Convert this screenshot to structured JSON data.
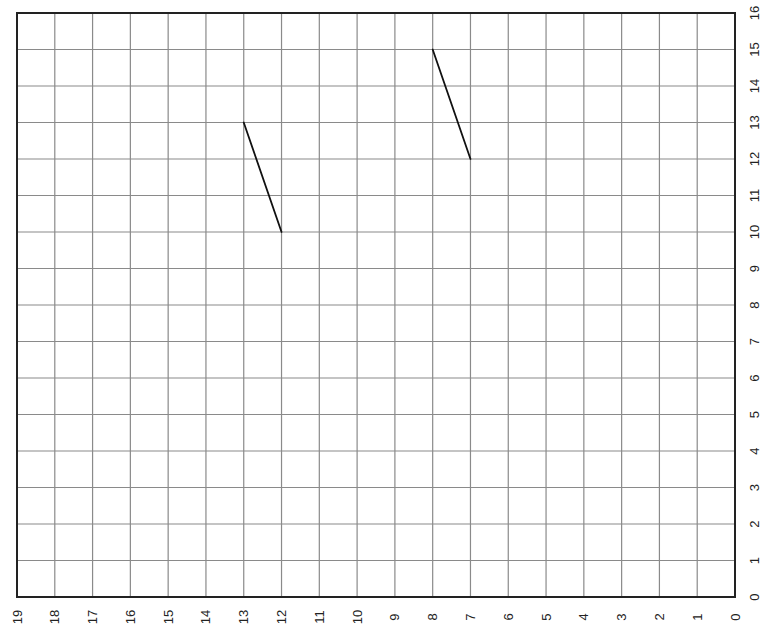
{
  "chart_data": {
    "type": "line",
    "title": "",
    "xlabel": "",
    "ylabel": "",
    "x_axis": {
      "min": 0,
      "max": 19,
      "reversed": true,
      "ticks": [
        0,
        1,
        2,
        3,
        4,
        5,
        6,
        7,
        8,
        9,
        10,
        11,
        12,
        13,
        14,
        15,
        16,
        17,
        18,
        19
      ],
      "tick_label_rotation": -90,
      "position": "bottom"
    },
    "y_axis": {
      "min": 0,
      "max": 16,
      "ticks": [
        0,
        1,
        2,
        3,
        4,
        5,
        6,
        7,
        8,
        9,
        10,
        11,
        12,
        13,
        14,
        15,
        16
      ],
      "tick_label_rotation": -90,
      "position": "right"
    },
    "xlim": [
      19,
      0
    ],
    "ylim": [
      0,
      16
    ],
    "grid": true,
    "legend": null,
    "series": [
      {
        "name": "segment-1",
        "x": [
          13,
          12
        ],
        "y": [
          13,
          10
        ]
      },
      {
        "name": "segment-2",
        "x": [
          8,
          7
        ],
        "y": [
          15,
          12
        ]
      }
    ]
  },
  "style": {
    "grid_color": "#8a8a8a",
    "frame_color": "#222222",
    "line_color": "#111111",
    "label_color": "#222222",
    "background": "#ffffff"
  },
  "layout": {
    "plot_left": 17,
    "plot_right": 735,
    "plot_top": 13,
    "plot_bottom": 597
  }
}
